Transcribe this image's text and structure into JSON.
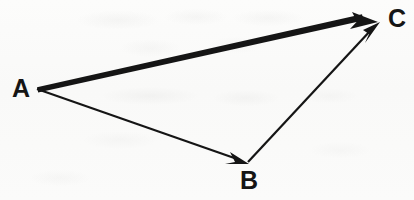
{
  "figure": {
    "width": 414,
    "height": 200,
    "background_color": "#fbfbfa",
    "ink_color": "#151515"
  },
  "points": [
    {
      "id": "A",
      "label": "A",
      "x": 37,
      "y": 89,
      "label_x": 21,
      "label_y": 89
    },
    {
      "id": "B",
      "label": "B",
      "x": 248,
      "y": 163,
      "label_x": 249,
      "label_y": 180
    },
    {
      "id": "C",
      "label": "C",
      "x": 379,
      "y": 23,
      "label_x": 397,
      "label_y": 19
    }
  ],
  "vectors": [
    {
      "id": "AC",
      "name": "resultant-vector-a-to-c",
      "from": "A",
      "to": "C",
      "x1": 37,
      "y1": 89,
      "x2": 379,
      "y2": 23,
      "stroke_width": 4,
      "style": "thick",
      "arrowhead": "filled-triangle",
      "color": "#151515"
    },
    {
      "id": "AB",
      "name": "vector-a-to-b",
      "from": "A",
      "to": "B",
      "x1": 37,
      "y1": 89,
      "x2": 248,
      "y2": 163,
      "stroke_width": 2,
      "style": "thin",
      "arrowhead": "filled-triangle",
      "color": "#151515"
    },
    {
      "id": "BC",
      "name": "vector-b-to-c",
      "from": "B",
      "to": "C",
      "x1": 248,
      "y1": 163,
      "x2": 379,
      "y2": 23,
      "stroke_width": 2,
      "style": "thin",
      "arrowhead": "filled-triangle",
      "color": "#151515"
    }
  ],
  "labels": {
    "A": "A",
    "B": "B",
    "C": "C"
  }
}
